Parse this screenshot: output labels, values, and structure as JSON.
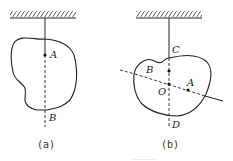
{
  "figure_a": {
    "caption": "(a)",
    "labels": {
      "A": "A",
      "B": "B"
    }
  },
  "figure_b": {
    "caption": "(b)",
    "labels": {
      "A": "A",
      "B": "B",
      "C": "C",
      "D": "D",
      "O": "O"
    }
  },
  "bottom_caption": "…………"
}
